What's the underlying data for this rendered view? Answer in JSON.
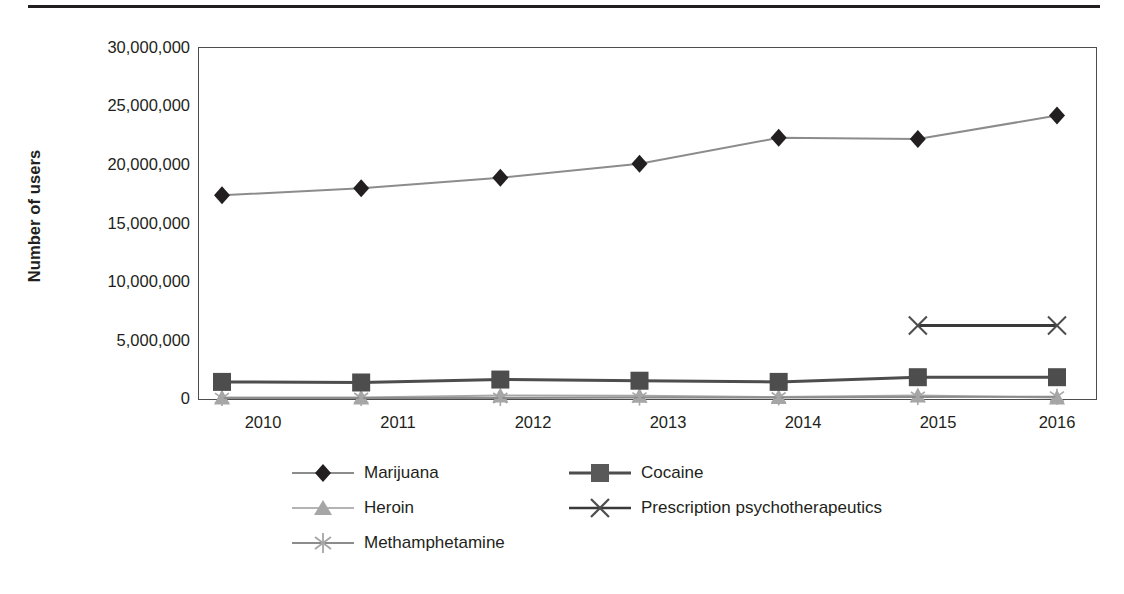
{
  "chart_data": {
    "type": "line",
    "title": "",
    "xlabel": "",
    "ylabel": "Number of users",
    "x": [
      2010,
      2011,
      2012,
      2013,
      2014,
      2015,
      2016
    ],
    "xticklabels": [
      "2010",
      "2011",
      "2012",
      "2013",
      "2014",
      "2015",
      "2016"
    ],
    "ylim": [
      0,
      30000000
    ],
    "yticks": [
      0,
      5000000,
      10000000,
      15000000,
      20000000,
      25000000,
      30000000
    ],
    "yticklabels": [
      "0",
      "5,000,000",
      "10,000,000",
      "15,000,000",
      "20,000,000",
      "25,000,000",
      "30,000,000"
    ],
    "grid": false,
    "legend_position": "bottom",
    "series": [
      {
        "name": "Marijuana",
        "marker": "diamond",
        "color": "#231f20",
        "line_color": "#8c8c8c",
        "x": [
          2010,
          2011,
          2012,
          2013,
          2014,
          2015,
          2016
        ],
        "values": [
          17400000,
          18000000,
          18900000,
          20100000,
          22300000,
          22200000,
          24200000
        ]
      },
      {
        "name": "Cocaine",
        "marker": "square",
        "color": "#4d4d4d",
        "line_color": "#4d4d4d",
        "x": [
          2010,
          2011,
          2012,
          2013,
          2014,
          2015,
          2016
        ],
        "values": [
          1500000,
          1450000,
          1700000,
          1600000,
          1500000,
          1900000,
          1900000
        ]
      },
      {
        "name": "Heroin",
        "marker": "triangle",
        "color": "#a6a6a6",
        "line_color": "#a6a6a6",
        "x": [
          2010,
          2011,
          2012,
          2013,
          2014,
          2015,
          2016
        ],
        "values": [
          180000,
          170000,
          340000,
          310000,
          210000,
          340000,
          170000
        ]
      },
      {
        "name": "Prescription psychotherapeutics",
        "marker": "x",
        "color": "#4d4d4d",
        "line_color": "#3a3a3a",
        "x": [
          2015,
          2016
        ],
        "values": [
          6300000,
          6300000
        ]
      },
      {
        "name": "Methamphetamine",
        "marker": "asterisk",
        "color": "#a6a6a6",
        "line_color": "#8c8c8c",
        "x": [
          2010,
          2011,
          2012,
          2013,
          2014,
          2015,
          2016
        ],
        "values": [
          120000,
          130000,
          130000,
          160000,
          170000,
          220000,
          240000
        ]
      }
    ]
  },
  "axis": {
    "y_label": "Number of users",
    "y_ticks": [
      {
        "label": "30,000,000",
        "value": 30000000
      },
      {
        "label": "25,000,000",
        "value": 25000000
      },
      {
        "label": "20,000,000",
        "value": 20000000
      },
      {
        "label": "15,000,000",
        "value": 15000000
      },
      {
        "label": "10,000,000",
        "value": 10000000
      },
      {
        "label": "5,000,000",
        "value": 5000000
      },
      {
        "label": "0",
        "value": 0
      }
    ],
    "x_ticks": [
      "2010",
      "2011",
      "2012",
      "2013",
      "2014",
      "2015",
      "2016"
    ]
  },
  "legend": {
    "rows": [
      [
        {
          "label": "Marijuana",
          "marker": "diamond-marker-icon"
        },
        {
          "label": "Cocaine",
          "marker": "square-marker-icon"
        }
      ],
      [
        {
          "label": "Heroin",
          "marker": "triangle-marker-icon"
        },
        {
          "label": "Prescription psychotherapeutics",
          "marker": "x-marker-icon"
        }
      ],
      [
        {
          "label": "Methamphetamine",
          "marker": "asterisk-marker-icon"
        }
      ]
    ]
  },
  "colors": {
    "ink": "#231f20",
    "dark_gray": "#4d4d4d",
    "mid_gray": "#8c8c8c",
    "light_gray": "#a6a6a6",
    "frame": "#4d4d4d"
  }
}
